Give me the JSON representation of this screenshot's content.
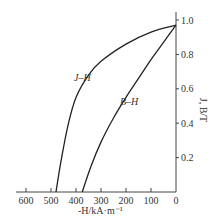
{
  "chart_data": {
    "type": "line",
    "title": "",
    "xlabel": "-H/kA·m⁻¹",
    "ylabel": "J, B/T",
    "xlim": [
      600,
      0
    ],
    "ylim": [
      0,
      1.0
    ],
    "x_ticks": [
      "600",
      "500",
      "400",
      "300",
      "200",
      "100",
      "0"
    ],
    "y_ticks": [
      "0.2",
      "0.4",
      "0.6",
      "0.8",
      "1.0"
    ],
    "grid": false,
    "legend": "inline labels",
    "series": [
      {
        "name": "J–H",
        "x": [
          0,
          100,
          200,
          300,
          350,
          400,
          430,
          460,
          480
        ],
        "y": [
          0.97,
          0.93,
          0.86,
          0.76,
          0.68,
          0.55,
          0.4,
          0.18,
          0.0
        ]
      },
      {
        "name": "B–H",
        "x": [
          0,
          50,
          100,
          150,
          200,
          250,
          300,
          340,
          375
        ],
        "y": [
          0.97,
          0.87,
          0.77,
          0.66,
          0.55,
          0.43,
          0.29,
          0.15,
          0.0
        ]
      }
    ]
  },
  "labels": {
    "x_axis": "-H/kA·m⁻¹",
    "y_axis": "J, B/T",
    "jh": "J–H",
    "bh": "B–H"
  }
}
